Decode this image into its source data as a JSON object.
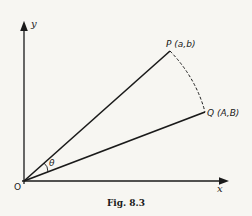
{
  "figure": {
    "caption": "Fig. 8.3",
    "axes": {
      "x_label": "x",
      "y_label": "y",
      "origin_label": "O"
    },
    "points": {
      "P": {
        "label": "P (a,b)"
      },
      "Q": {
        "label": "Q (A,B)"
      }
    },
    "angle_label": "θ",
    "colors": {
      "background": "#f7f6f2",
      "ink": "#1a1a1a"
    }
  }
}
